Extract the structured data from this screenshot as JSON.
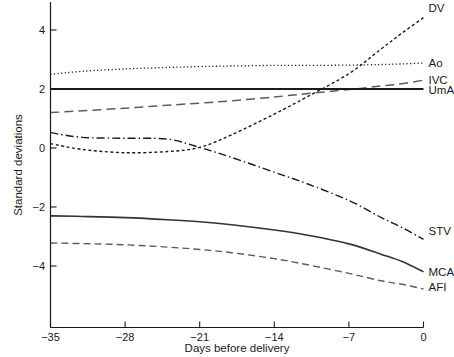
{
  "chart_data": {
    "type": "line",
    "title": "",
    "xlabel": "Days before delivery",
    "ylabel": "Standard deviations",
    "xlim": [
      -35,
      0
    ],
    "ylim": [
      -5.4,
      4.9
    ],
    "xticks": [
      -35,
      -28,
      -21,
      -14,
      -7,
      0
    ],
    "xticklabels": [
      "−35",
      "−28",
      "−21",
      "−14",
      "−7",
      "0"
    ],
    "yticks": [
      4,
      2,
      0,
      -2,
      -4
    ],
    "yticklabels": [
      "4",
      "2",
      "0",
      "−2",
      "−4"
    ],
    "grid": false,
    "legend_position": "right-inline-labels",
    "x": [
      -35,
      -32,
      -28,
      -24,
      -21,
      -18,
      -14,
      -11,
      -7,
      -4,
      -2,
      0
    ],
    "series": [
      {
        "name": "DV",
        "label": "DV",
        "color": "#1a1a1a",
        "dash": "3,2.5",
        "width": 1.4,
        "values": [
          0.15,
          -0.05,
          -0.16,
          -0.12,
          0.02,
          0.45,
          1.15,
          1.72,
          2.52,
          3.35,
          3.9,
          4.42
        ],
        "label_x": 0,
        "label_y": 4.75
      },
      {
        "name": "Ao",
        "label": "Ao",
        "color": "#1a1a1a",
        "dash": "1.2,2.4",
        "width": 1.3,
        "values": [
          2.5,
          2.6,
          2.68,
          2.73,
          2.76,
          2.78,
          2.8,
          2.8,
          2.81,
          2.83,
          2.85,
          2.88
        ],
        "label_x": 0,
        "label_y": 2.88
      },
      {
        "name": "IVC",
        "label": "IVC",
        "color": "#5c5c5c",
        "dash": "9,5",
        "width": 1.5,
        "values": [
          1.2,
          1.26,
          1.35,
          1.45,
          1.52,
          1.6,
          1.73,
          1.84,
          1.98,
          2.1,
          2.18,
          2.3
        ],
        "label_x": 0,
        "label_y": 2.32
      },
      {
        "name": "UmA",
        "label": "UmA",
        "color": "#1a1a1a",
        "dash": "none",
        "width": 1.9,
        "values": [
          2.0,
          2.0,
          2.0,
          2.0,
          2.0,
          2.0,
          2.0,
          2.0,
          2.0,
          2.0,
          2.0,
          2.0
        ],
        "label_x": 0,
        "label_y": 1.98
      },
      {
        "name": "STV",
        "label": "STV",
        "color": "#1a1a1a",
        "dash": "8,3,1.5,3",
        "width": 1.4,
        "values": [
          0.52,
          0.36,
          0.33,
          0.3,
          0.02,
          -0.32,
          -0.82,
          -1.2,
          -1.78,
          -2.35,
          -2.7,
          -3.1
        ],
        "label_x": 0,
        "label_y": -2.82
      },
      {
        "name": "MCA",
        "label": "MCA",
        "color": "#333333",
        "dash": "none",
        "width": 1.6,
        "values": [
          -2.3,
          -2.32,
          -2.36,
          -2.43,
          -2.5,
          -2.6,
          -2.78,
          -2.95,
          -3.25,
          -3.6,
          -3.85,
          -4.2
        ],
        "label_x": 0,
        "label_y": -4.22
      },
      {
        "name": "AFI",
        "label": "AFI",
        "color": "#5c5c5c",
        "dash": "7,4",
        "width": 1.4,
        "values": [
          -3.22,
          -3.24,
          -3.28,
          -3.36,
          -3.44,
          -3.55,
          -3.75,
          -3.95,
          -4.25,
          -4.5,
          -4.62,
          -4.78
        ],
        "label_x": 0,
        "label_y": -4.72
      }
    ]
  },
  "axis": {
    "x_title": "Days before delivery",
    "y_title": "Standard deviations"
  }
}
